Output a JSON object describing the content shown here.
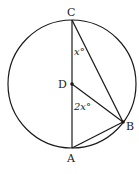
{
  "diagram": {
    "type": "circle-geometry",
    "circle": {
      "center": "D",
      "cx": 72,
      "cy": 84,
      "r": 64
    },
    "points": [
      {
        "name": "C",
        "x": 72,
        "y": 20,
        "label": "C"
      },
      {
        "name": "D",
        "x": 72,
        "y": 84,
        "label": "D"
      },
      {
        "name": "B",
        "x": 123,
        "y": 122,
        "label": "B"
      },
      {
        "name": "A",
        "x": 72,
        "y": 148,
        "label": "A"
      }
    ],
    "segments": [
      "CA",
      "CB",
      "DB",
      "AB"
    ],
    "angles": [
      {
        "vertex": "C",
        "label": "x°"
      },
      {
        "vertex": "D",
        "label": "2x°"
      }
    ],
    "colors": {
      "stroke": "#1a1a1a",
      "background": "#ffffff"
    }
  }
}
